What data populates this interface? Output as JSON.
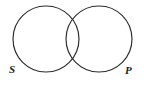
{
  "figure": {
    "type": "venn-diagram",
    "title": "",
    "background_color": "#ffffff",
    "stroke_color": "#2b2b2b",
    "label_color": "#1c1c1c",
    "width": 144,
    "height": 85
  },
  "circles": [
    {
      "id": "left-circle",
      "label": "S",
      "cx": 46,
      "cy": 39,
      "r": 33
    },
    {
      "id": "right-circle",
      "label": "P",
      "cx": 99,
      "cy": 39,
      "r": 33
    }
  ],
  "labels": {
    "subject": "S",
    "predicate": "P"
  }
}
